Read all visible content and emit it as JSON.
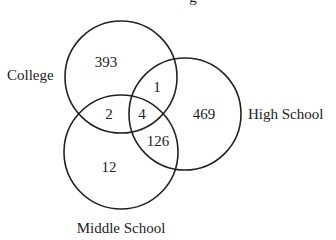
{
  "diagram": {
    "type": "venn",
    "title_fragment": "g",
    "sets": [
      {
        "name": "College",
        "cx": 121,
        "cy": 77,
        "r": 56
      },
      {
        "name": "High School",
        "cx": 185,
        "cy": 114,
        "r": 56
      },
      {
        "name": "Middle School",
        "cx": 121,
        "cy": 152,
        "r": 57
      }
    ],
    "regions": {
      "college_only": "393",
      "college_high": "1",
      "college_middle": "2",
      "all_three": "4",
      "high_only": "469",
      "high_middle": "126",
      "middle_only": "12"
    },
    "labels": {
      "college": "College",
      "high_school": "High School",
      "middle_school": "Middle School"
    },
    "stroke_color": "#222222"
  }
}
